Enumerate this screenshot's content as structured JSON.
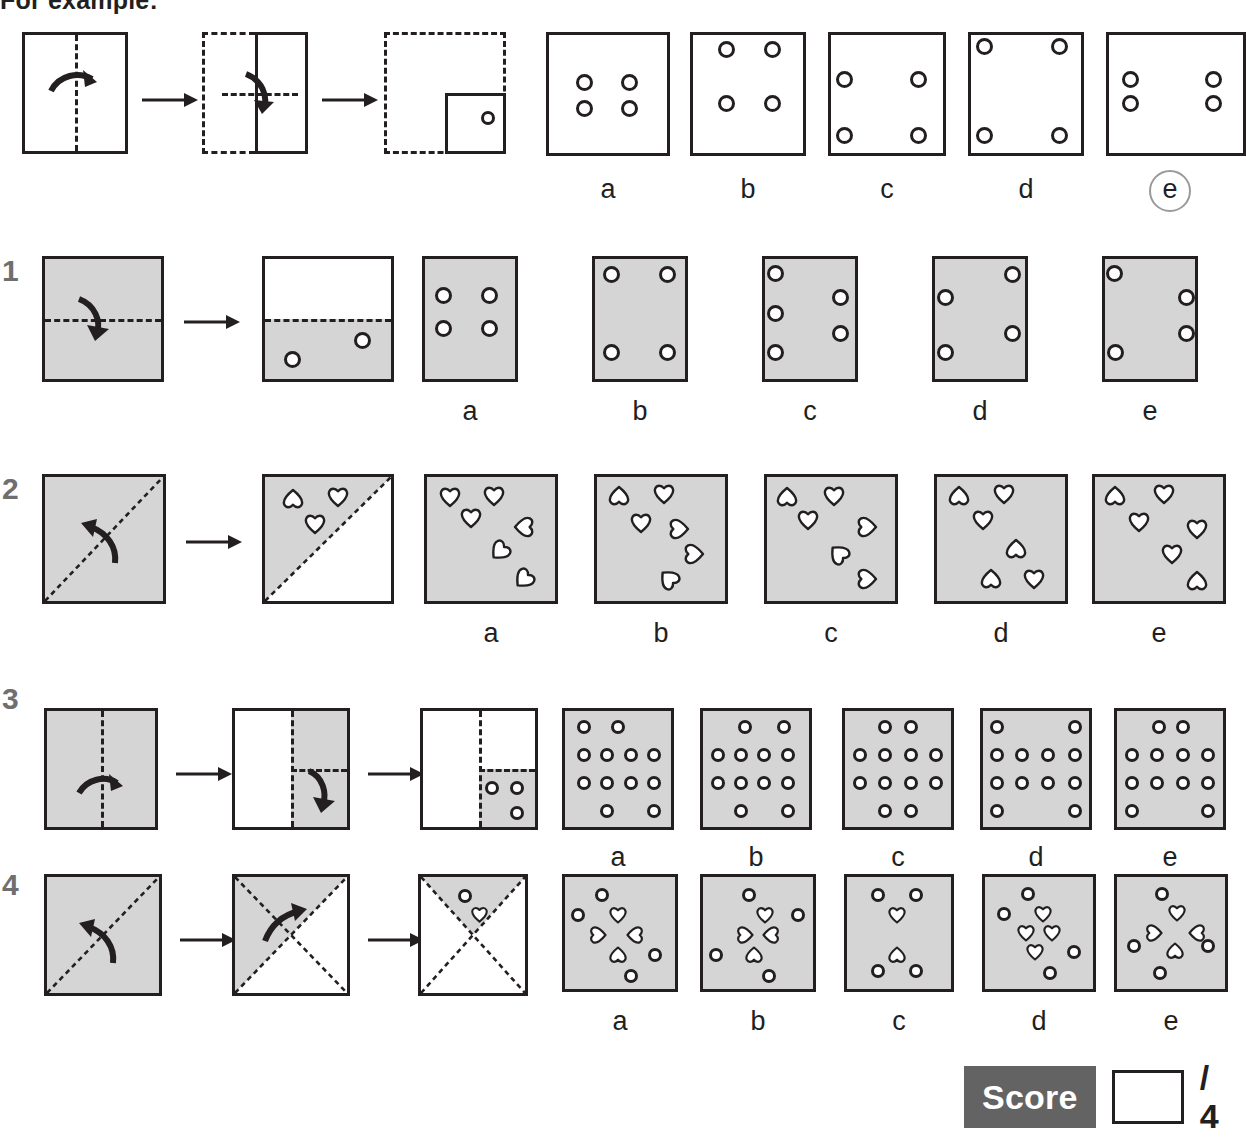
{
  "header": {
    "example_label": "For example:"
  },
  "score": {
    "label": "Score",
    "value": "",
    "total": "/ 4"
  },
  "option_letters": [
    "a",
    "b",
    "c",
    "d",
    "e"
  ],
  "rows": [
    {
      "number": "",
      "id": "example",
      "circled_answer": "e",
      "steps_note": "fold right half over left, then fold bottom up, punch one hole",
      "options": [
        {
          "letter": "a",
          "shapes": "4 circles clustered centre"
        },
        {
          "letter": "b",
          "shapes": "4 circles, top pair high"
        },
        {
          "letter": "c",
          "shapes": "4 circles, middle and bottom corners"
        },
        {
          "letter": "d",
          "shapes": "4 circles at the four corners"
        },
        {
          "letter": "e",
          "shapes": "4 circles, left and right pairs upper"
        }
      ]
    },
    {
      "number": "1",
      "id": "q1",
      "circled_answer": "",
      "steps_note": "fold top half down, punch two holes in lower half",
      "options": [
        {
          "letter": "a",
          "shapes": "4 circles in a centred square"
        },
        {
          "letter": "b",
          "shapes": "4 circles near the corners"
        },
        {
          "letter": "c",
          "shapes": "6 circles staggered down both sides"
        },
        {
          "letter": "d",
          "shapes": "5 circles staggered"
        },
        {
          "letter": "e",
          "shapes": "5 circles staggered"
        }
      ]
    },
    {
      "number": "2",
      "id": "q2",
      "circled_answer": "",
      "steps_note": "fold lower-right triangle up across diagonal, punch three hearts",
      "options": [
        {
          "letter": "a",
          "shapes": "6 hearts, mixed rotations"
        },
        {
          "letter": "b",
          "shapes": "6 hearts, mixed rotations"
        },
        {
          "letter": "c",
          "shapes": "6 hearts, mixed rotations"
        },
        {
          "letter": "d",
          "shapes": "6 hearts, mixed rotations"
        },
        {
          "letter": "e",
          "shapes": "6 hearts, mixed rotations"
        }
      ]
    },
    {
      "number": "3",
      "id": "q3",
      "circled_answer": "",
      "steps_note": "fold left half right, fold top down, punch three holes",
      "options": [
        {
          "letter": "a",
          "shapes": "12 circles, 4x4 grid with gaps"
        },
        {
          "letter": "b",
          "shapes": "12 circles, 4x4 grid with gaps"
        },
        {
          "letter": "c",
          "shapes": "12 circles, 4x4 grid with gaps"
        },
        {
          "letter": "d",
          "shapes": "12 circles, 4x4 grid with gaps"
        },
        {
          "letter": "e",
          "shapes": "12 circles, 4x4 grid with gaps"
        }
      ]
    },
    {
      "number": "4",
      "id": "q4",
      "circled_answer": "",
      "steps_note": "fold across diagonal twice, punch one circle and one heart",
      "options": [
        {
          "letter": "a",
          "shapes": "4 circles and 4 hearts"
        },
        {
          "letter": "b",
          "shapes": "4 circles and 3 hearts"
        },
        {
          "letter": "c",
          "shapes": "4 circles and 2 hearts"
        },
        {
          "letter": "d",
          "shapes": "4 circles and 4 hearts"
        },
        {
          "letter": "e",
          "shapes": "4 circles and 4 hearts"
        }
      ]
    }
  ],
  "geometry": {
    "note": "all coordinates are pixel positions inside each option panel, expressed 0-1",
    "example": {
      "options": {
        "a": {
          "circles": [
            [
              0.3,
              0.4
            ],
            [
              0.68,
              0.4
            ],
            [
              0.3,
              0.62
            ],
            [
              0.68,
              0.62
            ]
          ]
        },
        "b": {
          "circles": [
            [
              0.3,
              0.12
            ],
            [
              0.72,
              0.12
            ],
            [
              0.3,
              0.58
            ],
            [
              0.72,
              0.58
            ]
          ]
        },
        "c": {
          "circles": [
            [
              0.12,
              0.38
            ],
            [
              0.78,
              0.38
            ],
            [
              0.12,
              0.85
            ],
            [
              0.78,
              0.85
            ]
          ]
        },
        "d": {
          "circles": [
            [
              0.12,
              0.1
            ],
            [
              0.8,
              0.1
            ],
            [
              0.12,
              0.85
            ],
            [
              0.8,
              0.85
            ]
          ]
        },
        "e": {
          "circles": [
            [
              0.14,
              0.38
            ],
            [
              0.86,
              0.38
            ],
            [
              0.14,
              0.58
            ],
            [
              0.86,
              0.58
            ]
          ]
        }
      }
    },
    "q1": {
      "options": {
        "a": {
          "circles": [
            [
              0.2,
              0.3
            ],
            [
              0.72,
              0.3
            ],
            [
              0.2,
              0.58
            ],
            [
              0.72,
              0.58
            ]
          ]
        },
        "b": {
          "circles": [
            [
              0.18,
              0.13
            ],
            [
              0.8,
              0.13
            ],
            [
              0.18,
              0.78
            ],
            [
              0.8,
              0.78
            ]
          ]
        },
        "c": {
          "circles": [
            [
              0.1,
              0.12
            ],
            [
              0.84,
              0.32
            ],
            [
              0.1,
              0.45
            ],
            [
              0.84,
              0.62
            ],
            [
              0.1,
              0.78
            ]
          ]
        },
        "d": {
          "circles": [
            [
              0.86,
              0.13
            ],
            [
              0.12,
              0.32
            ],
            [
              0.86,
              0.62
            ],
            [
              0.12,
              0.78
            ]
          ]
        },
        "e": {
          "circles": [
            [
              0.1,
              0.12
            ],
            [
              0.9,
              0.32
            ],
            [
              0.9,
              0.62
            ],
            [
              0.12,
              0.78
            ]
          ]
        }
      }
    },
    "q2": {
      "fold_preview_hearts": [
        [
          0.22,
          0.18,
          0
        ],
        [
          0.6,
          0.16,
          0
        ],
        [
          0.42,
          0.38,
          0
        ]
      ],
      "options": {
        "a": {
          "hearts": [
            [
              0.18,
              0.16,
              0
            ],
            [
              0.52,
              0.15,
              0
            ],
            [
              0.34,
              0.33,
              0
            ],
            [
              0.76,
              0.4,
              90
            ],
            [
              0.58,
              0.6,
              45
            ],
            [
              0.76,
              0.82,
              45
            ]
          ]
        },
        "b": {
          "hearts": [
            [
              0.17,
              0.15,
              180
            ],
            [
              0.52,
              0.14,
              0
            ],
            [
              0.34,
              0.37,
              0
            ],
            [
              0.64,
              0.42,
              270
            ],
            [
              0.74,
              0.62,
              270
            ],
            [
              0.56,
              0.82,
              135
            ]
          ]
        },
        "c": {
          "hearts": [
            [
              0.16,
              0.16,
              180
            ],
            [
              0.52,
              0.15,
              0
            ],
            [
              0.32,
              0.35,
              0
            ],
            [
              0.78,
              0.4,
              270
            ],
            [
              0.56,
              0.62,
              135
            ],
            [
              0.78,
              0.82,
              270
            ]
          ]
        },
        "d": {
          "hearts": [
            [
              0.17,
              0.15,
              180
            ],
            [
              0.52,
              0.14,
              0
            ],
            [
              0.36,
              0.35,
              0
            ],
            [
              0.62,
              0.58,
              180
            ],
            [
              0.42,
              0.82,
              180
            ],
            [
              0.76,
              0.82,
              0
            ]
          ]
        },
        "e": {
          "hearts": [
            [
              0.16,
              0.15,
              180
            ],
            [
              0.54,
              0.14,
              0
            ],
            [
              0.34,
              0.36,
              0
            ],
            [
              0.8,
              0.42,
              0
            ],
            [
              0.6,
              0.62,
              0
            ],
            [
              0.8,
              0.84,
              180
            ]
          ]
        }
      }
    },
    "q3": {
      "options": {
        "a": {
          "circles": [
            [
              0.18,
              0.14
            ],
            [
              0.5,
              0.14
            ],
            [
              0.18,
              0.38
            ],
            [
              0.4,
              0.38
            ],
            [
              0.62,
              0.38
            ],
            [
              0.84,
              0.38
            ],
            [
              0.18,
              0.62
            ],
            [
              0.4,
              0.62
            ],
            [
              0.62,
              0.62
            ],
            [
              0.84,
              0.62
            ],
            [
              0.4,
              0.86
            ],
            [
              0.84,
              0.86
            ]
          ]
        },
        "b": {
          "circles": [
            [
              0.4,
              0.14
            ],
            [
              0.76,
              0.14
            ],
            [
              0.14,
              0.38
            ],
            [
              0.36,
              0.38
            ],
            [
              0.58,
              0.38
            ],
            [
              0.8,
              0.38
            ],
            [
              0.14,
              0.62
            ],
            [
              0.36,
              0.62
            ],
            [
              0.58,
              0.62
            ],
            [
              0.8,
              0.62
            ],
            [
              0.36,
              0.86
            ],
            [
              0.8,
              0.86
            ]
          ]
        },
        "c": {
          "circles": [
            [
              0.38,
              0.14
            ],
            [
              0.62,
              0.14
            ],
            [
              0.14,
              0.38
            ],
            [
              0.38,
              0.38
            ],
            [
              0.62,
              0.38
            ],
            [
              0.86,
              0.38
            ],
            [
              0.14,
              0.62
            ],
            [
              0.38,
              0.62
            ],
            [
              0.62,
              0.62
            ],
            [
              0.86,
              0.62
            ],
            [
              0.38,
              0.86
            ],
            [
              0.62,
              0.86
            ]
          ]
        },
        "d": {
          "circles": [
            [
              0.13,
              0.14
            ],
            [
              0.87,
              0.14
            ],
            [
              0.13,
              0.38
            ],
            [
              0.37,
              0.38
            ],
            [
              0.61,
              0.38
            ],
            [
              0.87,
              0.38
            ],
            [
              0.13,
              0.62
            ],
            [
              0.37,
              0.62
            ],
            [
              0.61,
              0.62
            ],
            [
              0.87,
              0.62
            ],
            [
              0.13,
              0.86
            ],
            [
              0.87,
              0.86
            ]
          ]
        },
        "e": {
          "circles": [
            [
              0.4,
              0.14
            ],
            [
              0.62,
              0.14
            ],
            [
              0.14,
              0.38
            ],
            [
              0.38,
              0.38
            ],
            [
              0.62,
              0.38
            ],
            [
              0.86,
              0.38
            ],
            [
              0.14,
              0.62
            ],
            [
              0.38,
              0.62
            ],
            [
              0.62,
              0.62
            ],
            [
              0.86,
              0.62
            ],
            [
              0.14,
              0.86
            ],
            [
              0.86,
              0.86
            ]
          ]
        }
      }
    },
    "q4": {
      "options": {
        "a": {
          "circles": [
            [
              0.34,
              0.16
            ],
            [
              0.12,
              0.34
            ],
            [
              0.82,
              0.7
            ],
            [
              0.6,
              0.88
            ]
          ],
          "hearts": [
            [
              0.48,
              0.34,
              0
            ],
            [
              0.3,
              0.52,
              270
            ],
            [
              0.64,
              0.52,
              90
            ],
            [
              0.48,
              0.7,
              180
            ]
          ]
        },
        "b": {
          "circles": [
            [
              0.42,
              0.16
            ],
            [
              0.86,
              0.34
            ],
            [
              0.12,
              0.7
            ],
            [
              0.6,
              0.88
            ]
          ],
          "hearts": [
            [
              0.56,
              0.34,
              0
            ],
            [
              0.38,
              0.52,
              270
            ],
            [
              0.62,
              0.52,
              90
            ],
            [
              0.46,
              0.7,
              180
            ]
          ]
        },
        "c": {
          "circles": [
            [
              0.3,
              0.16
            ],
            [
              0.66,
              0.16
            ],
            [
              0.3,
              0.84
            ],
            [
              0.66,
              0.84
            ]
          ],
          "hearts": [
            [
              0.48,
              0.34,
              0
            ],
            [
              0.48,
              0.7,
              180
            ]
          ]
        },
        "d": {
          "circles": [
            [
              0.4,
              0.15
            ],
            [
              0.18,
              0.33
            ],
            [
              0.82,
              0.67
            ],
            [
              0.6,
              0.86
            ]
          ],
          "hearts": [
            [
              0.54,
              0.33,
              0
            ],
            [
              0.38,
              0.5,
              0
            ],
            [
              0.62,
              0.5,
              0
            ],
            [
              0.46,
              0.67,
              0
            ]
          ]
        },
        "e": {
          "circles": [
            [
              0.42,
              0.15
            ],
            [
              0.16,
              0.62
            ],
            [
              0.84,
              0.62
            ],
            [
              0.4,
              0.86
            ]
          ],
          "hearts": [
            [
              0.56,
              0.32,
              0
            ],
            [
              0.34,
              0.5,
              270
            ],
            [
              0.74,
              0.5,
              90
            ],
            [
              0.54,
              0.66,
              180
            ]
          ]
        }
      }
    }
  }
}
